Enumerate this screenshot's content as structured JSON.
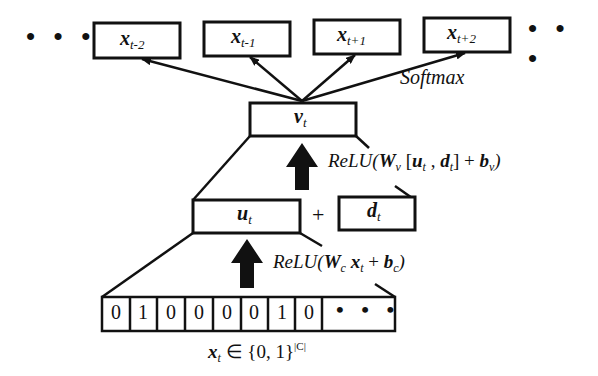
{
  "diagram": {
    "type": "neural-network-architecture",
    "output_layer": {
      "nodes": [
        {
          "var": "x",
          "sub": "t-2"
        },
        {
          "var": "x",
          "sub": "t-1"
        },
        {
          "var": "x",
          "sub": "t+1"
        },
        {
          "var": "x",
          "sub": "t+2"
        }
      ],
      "left_ellipsis": "• • •",
      "right_ellipsis": "• • •",
      "activation_label": "Softmax"
    },
    "hidden_v": {
      "var": "v",
      "sub": "t"
    },
    "equation_v": {
      "prefix": "ReLU(",
      "W": "W",
      "W_sub": "v",
      "open": " [",
      "u": "u",
      "u_sub": "t",
      "comma": " , ",
      "d": "d",
      "d_sub": "t",
      "close": "] + ",
      "b": "b",
      "b_sub": "v",
      "suffix": ")"
    },
    "hidden_u": {
      "var": "u",
      "sub": "t"
    },
    "plus": "+",
    "doc_vector": {
      "var": "d",
      "sub": "t"
    },
    "equation_u": {
      "prefix": "ReLU(",
      "W": "W",
      "W_sub": "c",
      "x": " x",
      "x_sub": "t",
      "plus": " + ",
      "b": "b",
      "b_sub": "c",
      "suffix": ")"
    },
    "input_vector": {
      "cells": [
        "0",
        "1",
        "0",
        "0",
        "0",
        "0",
        "1",
        "0"
      ],
      "ellipsis": "• • •",
      "caption_var": "x",
      "caption_sub": "t",
      "caption_rest": " ∈ {0, 1}",
      "caption_sup": "|C|"
    },
    "colors": {
      "line": "#111111",
      "background": "#ffffff"
    }
  }
}
